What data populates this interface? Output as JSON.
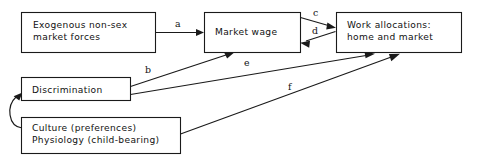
{
  "diagram": {
    "background_color": "#ffffff",
    "line_color": "#1a1a1a",
    "text_color": "#111111",
    "nodes": [
      {
        "id": "exogenous",
        "line1": "Exogenous non-sex",
        "line2": "market forces"
      },
      {
        "id": "market_wage",
        "line1": "Market wage",
        "line2": ""
      },
      {
        "id": "work_allocations",
        "line1": "Work allocations:",
        "line2": "home and market"
      },
      {
        "id": "discrimination",
        "line1": "Discrimination",
        "line2": ""
      },
      {
        "id": "culture",
        "line1": "Culture (preferences)",
        "line2": "Physiology (child-bearing)"
      }
    ],
    "edges": [
      {
        "id": "a",
        "label": "a",
        "from": "exogenous",
        "to": "market_wage"
      },
      {
        "id": "b",
        "label": "b",
        "from": "discrimination",
        "to": "market_wage"
      },
      {
        "id": "c",
        "label": "c",
        "from": "market_wage",
        "to": "work_allocations"
      },
      {
        "id": "d",
        "label": "d",
        "from": "work_allocations",
        "to": "market_wage"
      },
      {
        "id": "e",
        "label": "e",
        "from": "discrimination",
        "to": "work_allocations"
      },
      {
        "id": "f",
        "label": "f",
        "from": "culture",
        "to": "work_allocations"
      },
      {
        "id": "loop",
        "label": "",
        "from": "culture",
        "to": "discrimination"
      }
    ]
  }
}
